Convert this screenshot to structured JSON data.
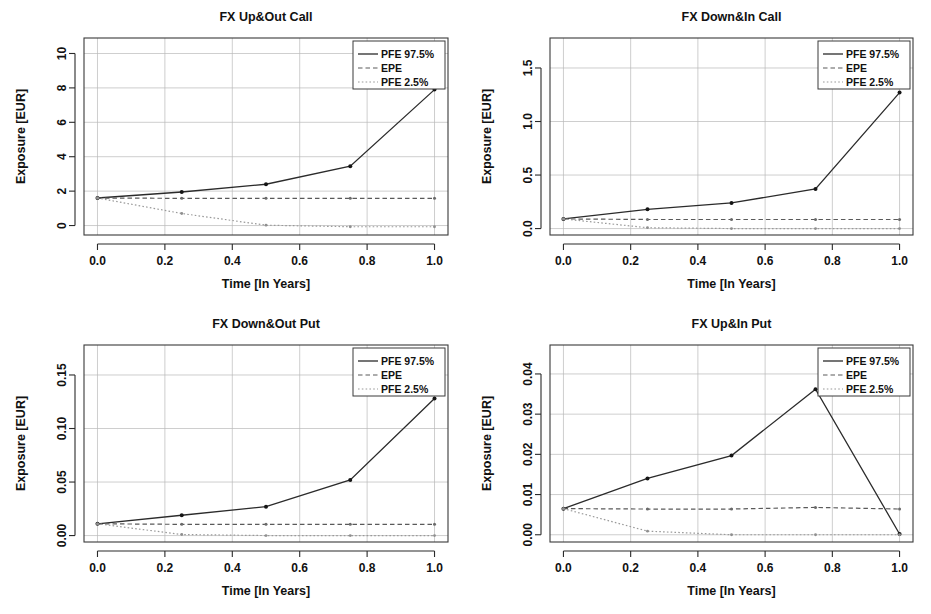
{
  "figure": {
    "panel_count": 4,
    "shared_xlabel": "Time [In Years]",
    "shared_ylabel": "Exposure [EUR]",
    "legend_entries": [
      "PFE 97.5%",
      "EPE",
      "PFE 2.5%"
    ],
    "colors": {
      "pfe_upper": "#2b2b2b",
      "epe": "#5a5a5a",
      "pfe_lower": "#9a9a9a",
      "grid": "#b9b9b9",
      "frame": "#3a3a3a",
      "background": "#ffffff"
    }
  },
  "chart_data": [
    {
      "type": "line",
      "title": "FX Up&Out Call",
      "xlabel": "Time [In Years]",
      "ylabel": "Exposure [EUR]",
      "x": [
        0.0,
        0.25,
        0.5,
        0.75,
        1.0
      ],
      "xlim": [
        -0.04,
        1.04
      ],
      "ylim": [
        -0.55,
        10.9
      ],
      "xticks": [
        0.0,
        0.2,
        0.4,
        0.6,
        0.8,
        1.0
      ],
      "xticklabels": [
        "0.0",
        "0.2",
        "0.4",
        "0.6",
        "0.8",
        "1.0"
      ],
      "yticks": [
        0,
        2,
        4,
        6,
        8,
        10
      ],
      "yticklabels": [
        "0",
        "2",
        "4",
        "6",
        "8",
        "10"
      ],
      "grid": true,
      "legend_position": "top-right",
      "series": [
        {
          "name": "PFE 97.5%",
          "style": "solid",
          "values": [
            1.6,
            1.95,
            2.4,
            3.45,
            7.9
          ]
        },
        {
          "name": "EPE",
          "style": "dashed",
          "values": [
            1.6,
            1.58,
            1.58,
            1.58,
            1.58
          ]
        },
        {
          "name": "PFE 2.5%",
          "style": "dotted",
          "values": [
            1.6,
            0.7,
            0.02,
            -0.07,
            -0.07
          ]
        }
      ]
    },
    {
      "type": "line",
      "title": "FX Down&In Call",
      "xlabel": "Time [In Years]",
      "ylabel": "Exposure [EUR]",
      "x": [
        0.0,
        0.25,
        0.5,
        0.75,
        1.0
      ],
      "xlim": [
        -0.04,
        1.04
      ],
      "ylim": [
        -0.06,
        1.78
      ],
      "xticks": [
        0.0,
        0.2,
        0.4,
        0.6,
        0.8,
        1.0
      ],
      "xticklabels": [
        "0.0",
        "0.2",
        "0.4",
        "0.6",
        "0.8",
        "1.0"
      ],
      "yticks": [
        0.0,
        0.5,
        1.0,
        1.5
      ],
      "yticklabels": [
        "0.0",
        "0.5",
        "1.0",
        "1.5"
      ],
      "grid": true,
      "legend_position": "top-right",
      "series": [
        {
          "name": "PFE 97.5%",
          "style": "solid",
          "values": [
            0.09,
            0.18,
            0.24,
            0.37,
            1.27
          ]
        },
        {
          "name": "EPE",
          "style": "dashed",
          "values": [
            0.09,
            0.085,
            0.085,
            0.085,
            0.085
          ]
        },
        {
          "name": "PFE 2.5%",
          "style": "dotted",
          "values": [
            0.09,
            0.008,
            0.0,
            0.0,
            0.0
          ]
        }
      ]
    },
    {
      "type": "line",
      "title": "FX Down&Out Put",
      "xlabel": "Time [In Years]",
      "ylabel": "Exposure [EUR]",
      "x": [
        0.0,
        0.25,
        0.5,
        0.75,
        1.0
      ],
      "xlim": [
        -0.04,
        1.04
      ],
      "ylim": [
        -0.006,
        0.178
      ],
      "xticks": [
        0.0,
        0.2,
        0.4,
        0.6,
        0.8,
        1.0
      ],
      "xticklabels": [
        "0.0",
        "0.2",
        "0.4",
        "0.6",
        "0.8",
        "1.0"
      ],
      "yticks": [
        0.0,
        0.05,
        0.1,
        0.15
      ],
      "yticklabels": [
        "0.00",
        "0.05",
        "0.10",
        "0.15"
      ],
      "grid": true,
      "legend_position": "top-right",
      "series": [
        {
          "name": "PFE 97.5%",
          "style": "solid",
          "values": [
            0.011,
            0.019,
            0.027,
            0.052,
            0.128
          ]
        },
        {
          "name": "EPE",
          "style": "dashed",
          "values": [
            0.011,
            0.0105,
            0.0105,
            0.0105,
            0.0105
          ]
        },
        {
          "name": "PFE 2.5%",
          "style": "dotted",
          "values": [
            0.011,
            0.001,
            0.0,
            0.0,
            0.0
          ]
        }
      ]
    },
    {
      "type": "line",
      "title": "FX Up&In Put",
      "xlabel": "Time [In Years]",
      "ylabel": "Exposure [EUR]",
      "x": [
        0.0,
        0.25,
        0.5,
        0.75,
        1.0
      ],
      "xlim": [
        -0.04,
        1.04
      ],
      "ylim": [
        -0.0018,
        0.0472
      ],
      "xticks": [
        0.0,
        0.2,
        0.4,
        0.6,
        0.8,
        1.0
      ],
      "xticklabels": [
        "0.0",
        "0.2",
        "0.4",
        "0.6",
        "0.8",
        "1.0"
      ],
      "yticks": [
        0.0,
        0.01,
        0.02,
        0.03,
        0.04
      ],
      "yticklabels": [
        "0.00",
        "0.01",
        "0.02",
        "0.03",
        "0.04"
      ],
      "grid": true,
      "legend_position": "top-right",
      "series": [
        {
          "name": "PFE 97.5%",
          "style": "solid",
          "values": [
            0.0065,
            0.014,
            0.0197,
            0.0362,
            0.0002
          ]
        },
        {
          "name": "EPE",
          "style": "dashed",
          "values": [
            0.0065,
            0.0064,
            0.0064,
            0.0068,
            0.0064
          ]
        },
        {
          "name": "PFE 2.5%",
          "style": "dotted",
          "values": [
            0.0065,
            0.0009,
            0.0,
            0.0,
            0.0
          ]
        }
      ]
    }
  ]
}
